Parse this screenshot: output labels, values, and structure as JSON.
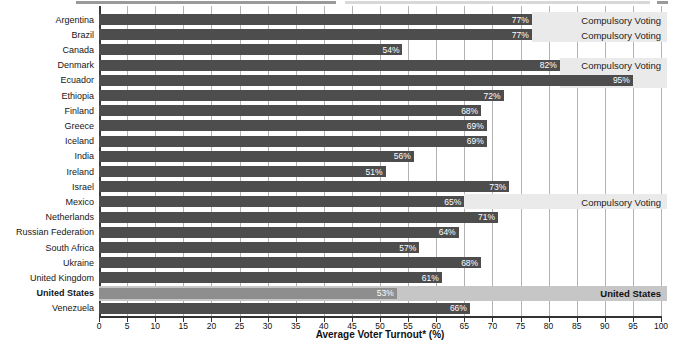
{
  "chart_data": {
    "type": "bar",
    "orientation": "horizontal",
    "title": "",
    "xlabel": "Average Voter Turnout* (%)",
    "ylabel": "",
    "xlim": [
      0,
      100
    ],
    "xticks": [
      0,
      5,
      10,
      15,
      20,
      25,
      30,
      35,
      40,
      45,
      50,
      55,
      60,
      65,
      70,
      75,
      80,
      85,
      90,
      95,
      100
    ],
    "grid": true,
    "legend": false,
    "categories": [
      "Argentina",
      "Brazil",
      "Canada",
      "Denmark",
      "Ecuador",
      "Ethiopia",
      "Finland",
      "Greece",
      "Iceland",
      "India",
      "Ireland",
      "Israel",
      "Mexico",
      "Netherlands",
      "Russian Federation",
      "South Africa",
      "Ukraine",
      "United Kingdom",
      "United States",
      "Venezuela"
    ],
    "values": [
      77,
      77,
      54,
      82,
      95,
      72,
      68,
      69,
      69,
      56,
      51,
      73,
      65,
      71,
      64,
      57,
      68,
      61,
      53,
      66
    ],
    "countries": [
      {
        "label": "Argentina",
        "value": 77,
        "value_label": "77%",
        "annotation": "Compulsory Voting",
        "band": "compulsory",
        "bar": "dark",
        "bold": false
      },
      {
        "label": "Brazil",
        "value": 77,
        "value_label": "77%",
        "annotation": "Compulsory Voting",
        "band": "compulsory",
        "bar": "dark",
        "bold": false
      },
      {
        "label": "Canada",
        "value": 54,
        "value_label": "54%",
        "annotation": "",
        "band": "",
        "bar": "dark",
        "bold": false
      },
      {
        "label": "Denmark",
        "value": 82,
        "value_label": "82%",
        "annotation": "Compulsory Voting",
        "band": "compulsory",
        "bar": "dark",
        "bold": false
      },
      {
        "label": "Ecuador",
        "value": 95,
        "value_label": "95%",
        "annotation": "",
        "band": "compulsory",
        "bar": "dark",
        "bold": false
      },
      {
        "label": "Ethiopia",
        "value": 72,
        "value_label": "72%",
        "annotation": "",
        "band": "",
        "bar": "dark",
        "bold": false
      },
      {
        "label": "Finland",
        "value": 68,
        "value_label": "68%",
        "annotation": "",
        "band": "",
        "bar": "dark",
        "bold": false
      },
      {
        "label": "Greece",
        "value": 69,
        "value_label": "69%",
        "annotation": "",
        "band": "",
        "bar": "dark",
        "bold": false
      },
      {
        "label": "Iceland",
        "value": 69,
        "value_label": "69%",
        "annotation": "",
        "band": "",
        "bar": "dark",
        "bold": false
      },
      {
        "label": "India",
        "value": 56,
        "value_label": "56%",
        "annotation": "",
        "band": "",
        "bar": "dark",
        "bold": false
      },
      {
        "label": "Ireland",
        "value": 51,
        "value_label": "51%",
        "annotation": "",
        "band": "",
        "bar": "dark",
        "bold": false
      },
      {
        "label": "Israel",
        "value": 73,
        "value_label": "73%",
        "annotation": "",
        "band": "",
        "bar": "dark",
        "bold": false
      },
      {
        "label": "Mexico",
        "value": 65,
        "value_label": "65%",
        "annotation": "Compulsory Voting",
        "band": "compulsory",
        "bar": "dark",
        "bold": false
      },
      {
        "label": "Netherlands",
        "value": 71,
        "value_label": "71%",
        "annotation": "",
        "band": "",
        "bar": "dark",
        "bold": false
      },
      {
        "label": "Russian Federation",
        "value": 64,
        "value_label": "64%",
        "annotation": "",
        "band": "",
        "bar": "dark",
        "bold": false
      },
      {
        "label": "South Africa",
        "value": 57,
        "value_label": "57%",
        "annotation": "",
        "band": "",
        "bar": "dark",
        "bold": false
      },
      {
        "label": "Ukraine",
        "value": 68,
        "value_label": "68%",
        "annotation": "",
        "band": "",
        "bar": "dark",
        "bold": false
      },
      {
        "label": "United Kingdom",
        "value": 61,
        "value_label": "61%",
        "annotation": "",
        "band": "",
        "bar": "dark",
        "bold": false
      },
      {
        "label": "United States",
        "value": 53,
        "value_label": "53%",
        "annotation": "United States",
        "band": "united_states",
        "bar": "light",
        "bold": true
      },
      {
        "label": "Venezuela",
        "value": 66,
        "value_label": "66%",
        "annotation": "",
        "band": "",
        "bar": "dark",
        "bold": false
      }
    ],
    "colors": {
      "bar_dark": "#4d4d4d",
      "bar_light": "#8e8e8e",
      "band_compulsory": "#eaeaea",
      "band_united_states": "#c6c6c6",
      "gridline": "#b3b3b3",
      "axis": "#333333",
      "value_text": "#ffffff",
      "label_text": "#161616"
    }
  }
}
